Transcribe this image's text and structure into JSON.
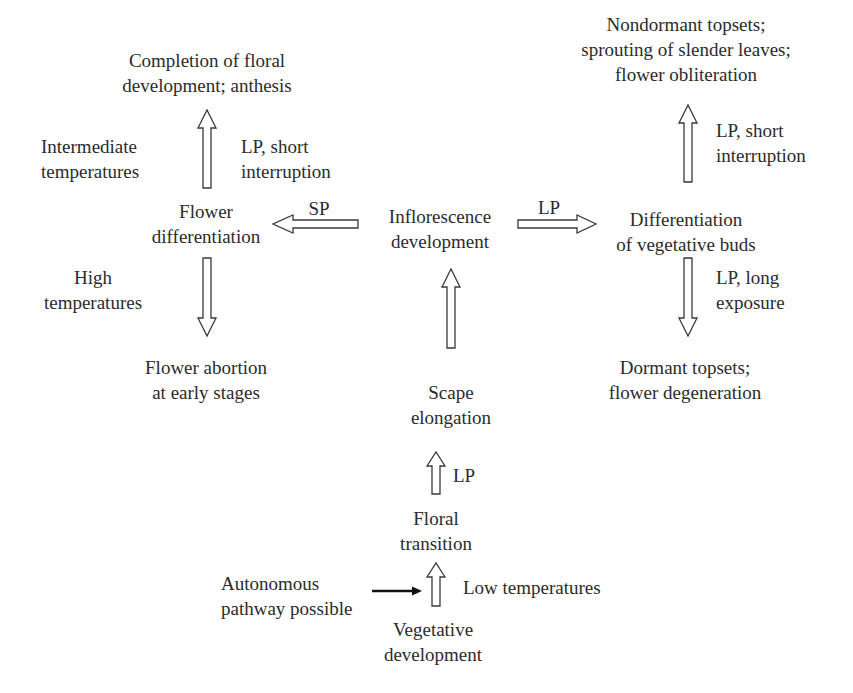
{
  "diagram": {
    "nodes": {
      "completion": {
        "lines": [
          "Completion of floral",
          "development; anthesis"
        ]
      },
      "flower_diff": {
        "lines": [
          "Flower",
          "differentiation"
        ]
      },
      "abortion": {
        "lines": [
          "Flower abortion",
          "at early stages"
        ]
      },
      "inflorescence": {
        "lines": [
          "Inflorescence",
          "development"
        ]
      },
      "scape": {
        "lines": [
          "Scape",
          "elongation"
        ]
      },
      "floral_transition": {
        "lines": [
          "Floral",
          "transition"
        ]
      },
      "vegetative": {
        "lines": [
          "Vegetative",
          "development"
        ]
      },
      "veg_buds": {
        "lines": [
          "Differentiation",
          "of vegetative buds"
        ]
      },
      "nondormant": {
        "lines": [
          "Nondormant topsets;",
          "sprouting of slender leaves;",
          "flower obliteration"
        ]
      },
      "dormant": {
        "lines": [
          "Dormant topsets;",
          "flower degeneration"
        ]
      },
      "autonomous": {
        "lines": [
          "Autonomous",
          "pathway possible"
        ]
      }
    },
    "conditions": {
      "intermediate_temps": {
        "lines": [
          "Intermediate",
          "temperatures"
        ]
      },
      "lp_short_left": {
        "lines": [
          "LP, short",
          "interruption"
        ]
      },
      "sp": {
        "lines": [
          "SP"
        ]
      },
      "high_temps": {
        "lines": [
          "High",
          "temperatures"
        ]
      },
      "lp_right": {
        "lines": [
          "LP"
        ]
      },
      "lp_short_right": {
        "lines": [
          "LP, short",
          "interruption"
        ]
      },
      "lp_long": {
        "lines": [
          "LP, long",
          "exposure"
        ]
      },
      "lp_scape": {
        "lines": [
          "LP"
        ]
      },
      "low_temps": {
        "lines": [
          "Low temperatures"
        ]
      }
    },
    "edges": [
      {
        "from": "Vegetative development",
        "to": "Floral transition",
        "label": "Low temperatures"
      },
      {
        "from": "Autonomous pathway possible",
        "to": "Vegetative→Floral transition arrow",
        "label": ""
      },
      {
        "from": "Floral transition",
        "to": "Scape elongation",
        "label": "LP"
      },
      {
        "from": "Scape elongation",
        "to": "Inflorescence development",
        "label": ""
      },
      {
        "from": "Inflorescence development",
        "to": "Flower differentiation",
        "label": "SP"
      },
      {
        "from": "Inflorescence development",
        "to": "Differentiation of vegetative buds",
        "label": "LP"
      },
      {
        "from": "Flower differentiation",
        "to": "Completion of floral development; anthesis",
        "label": "Intermediate temperatures / LP, short interruption"
      },
      {
        "from": "Flower differentiation",
        "to": "Flower abortion at early stages",
        "label": "High temperatures"
      },
      {
        "from": "Differentiation of vegetative buds",
        "to": "Nondormant topsets; sprouting of slender leaves; flower obliteration",
        "label": "LP, short interruption"
      },
      {
        "from": "Differentiation of vegetative buds",
        "to": "Dormant topsets; flower degeneration",
        "label": "LP, long exposure"
      }
    ],
    "colors": {
      "text": "#2b2b2b",
      "arrow_stroke": "#3a3a3a",
      "solid_arrow": "#111111",
      "background": "#ffffff"
    }
  }
}
